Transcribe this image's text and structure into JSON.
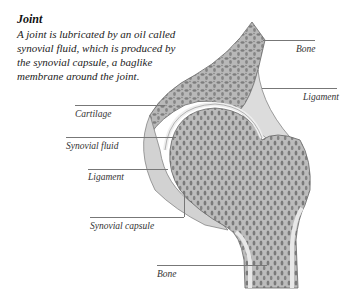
{
  "header": {
    "title": "Joint",
    "description": "A joint is lubricated by an oil called synovial fluid, which is produced by the synovial capsule, a baglike membrane around the joint."
  },
  "diagram": {
    "labels": [
      {
        "id": "bone-top",
        "text": "Bone"
      },
      {
        "id": "ligament-right",
        "text": "Ligament"
      },
      {
        "id": "cartilage",
        "text": "Cartilage"
      },
      {
        "id": "synovial-fluid",
        "text": "Synovial fluid"
      },
      {
        "id": "ligament-left",
        "text": "Ligament"
      },
      {
        "id": "synovial-capsule",
        "text": "Synovial capsule"
      },
      {
        "id": "bone-bottom",
        "text": "Bone"
      }
    ],
    "colors": {
      "bone_fill": "#9a9a9a",
      "bone_outline": "#666666",
      "cartilage": "#e6e6e6",
      "leader_line": "#777777"
    }
  }
}
